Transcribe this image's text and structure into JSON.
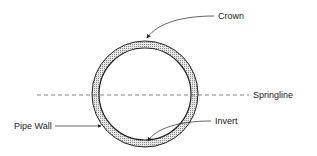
{
  "diagram": {
    "labels": {
      "crown": "Crown",
      "springline": "Springline",
      "pipe_wall": "Pipe Wall",
      "invert": "Invert"
    },
    "colors": {
      "line": "#222222",
      "wall_fill": "#bdbdbd",
      "background": "#ffffff"
    }
  }
}
